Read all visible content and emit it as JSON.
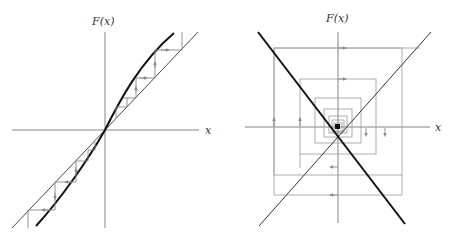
{
  "figure": {
    "panels": [
      {
        "id": "left",
        "ylabel": "F(x)",
        "xlabel": "x",
        "description": "Cobweb diagram: curve F(x) steeper than diagonal at origin; iterations diverge away from fixed point at origin"
      },
      {
        "id": "right",
        "ylabel": "F(x)",
        "xlabel": "x",
        "description": "Cobweb diagram: F(x) = -x line crossing diagonal; iterations form a square spiral around the fixed point at origin"
      }
    ],
    "colors": {
      "axis": "#555555",
      "diagonal": "#333333",
      "curve": "#111111",
      "cobweb": "#888888"
    }
  }
}
